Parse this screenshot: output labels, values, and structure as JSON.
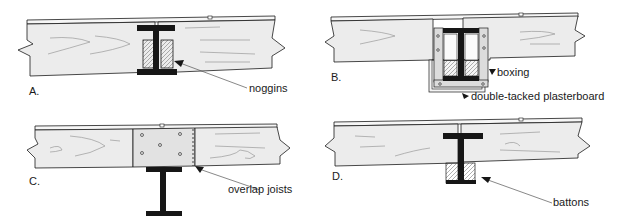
{
  "diagram": {
    "type": "construction-detail",
    "colors": {
      "ink": "#1a1a1a",
      "timber": "#ececec",
      "timber_grain": "#9a9a9a",
      "steel": "#161616",
      "noggin": "#b8b8b8",
      "boxing": "#dcdcdc",
      "background": "#ffffff"
    },
    "panels": [
      {
        "id": "A",
        "letter": "A.",
        "callout": "noggins",
        "components": [
          "floorboard",
          "timber joists",
          "steel I-beam",
          "noggins"
        ]
      },
      {
        "id": "B",
        "letter": "B.",
        "callouts": [
          "boxing",
          "double-tacked plasterboard"
        ],
        "components": [
          "floorboard",
          "timber joists",
          "steel I-beam",
          "noggins",
          "boxing",
          "plasterboard"
        ]
      },
      {
        "id": "C",
        "letter": "C.",
        "callout": "overlap joists",
        "components": [
          "floorboard",
          "overlapping timber joists",
          "bolts",
          "steel I-beam"
        ]
      },
      {
        "id": "D",
        "letter": "D.",
        "callout": "battons",
        "components": [
          "floorboard",
          "timber joists",
          "steel I-beam",
          "battons"
        ]
      }
    ]
  }
}
